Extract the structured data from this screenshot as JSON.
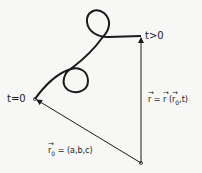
{
  "labels": {
    "start": "t=0",
    "end": "t>0",
    "position_vector": {
      "lhs": "r",
      "eq": " = ",
      "func": "r",
      "open": " (",
      "arg": "r",
      "sub": "0",
      "rest": ",t)"
    },
    "initial_vector": {
      "sym": "r",
      "sub": "0",
      "rest": " = (a,b,c)"
    }
  },
  "colors": {
    "ink": "#1a1a1a",
    "background": "#f7f7f5"
  }
}
